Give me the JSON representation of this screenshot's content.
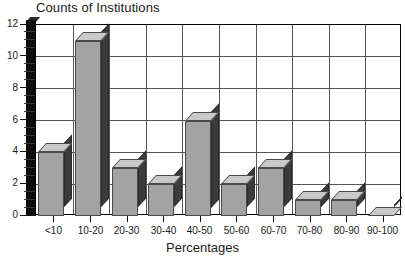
{
  "chart_data": {
    "type": "bar",
    "title": "Counts of Institutions",
    "xlabel": "Percentages",
    "ylabel": "",
    "categories": [
      "<10",
      "10-20",
      "20-30",
      "30-40",
      "40-50",
      "50-60",
      "60-70",
      "70-80",
      "80-90",
      "90-100"
    ],
    "values": [
      4,
      11,
      3,
      2,
      6,
      2,
      3,
      1,
      1,
      0
    ],
    "ylim": [
      0,
      12
    ],
    "ytick_labels": [
      "0",
      "2",
      "4",
      "6",
      "8",
      "10",
      "12"
    ],
    "ytick_values": [
      0,
      2,
      4,
      6,
      8,
      10,
      12
    ],
    "yminor_step": 0.5,
    "grid": "both",
    "legend": "none",
    "style": "3d-bar",
    "colors": {
      "bar_front": "#a3a3a3",
      "bar_top": "#c9c9c9",
      "bar_side": "#3b3b3b",
      "axis": "#000000",
      "grid": "#555555",
      "background": "#ffffff",
      "text": "#1a1a1a"
    }
  }
}
